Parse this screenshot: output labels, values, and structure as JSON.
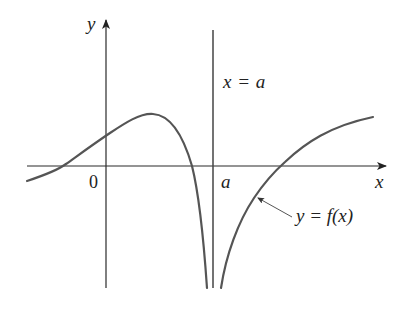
{
  "diagram": {
    "colors": {
      "axis": "#2a2a2a",
      "curve": "#555555",
      "asymptote": "#444444",
      "text": "#222222",
      "background": "#ffffff"
    },
    "axes": {
      "x_label": "x",
      "y_label": "y",
      "origin_label": "0",
      "a_tick_label": "a"
    },
    "asymptote": {
      "label": "x = a"
    },
    "curve": {
      "label": "y = f(x)"
    }
  }
}
